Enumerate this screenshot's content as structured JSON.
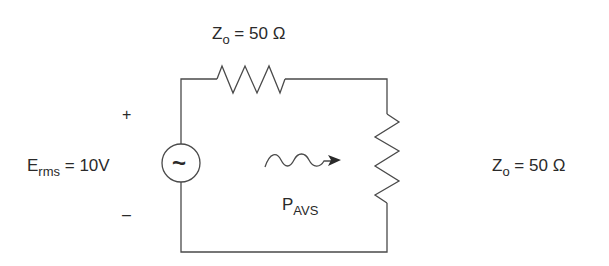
{
  "diagram": {
    "type": "circuit",
    "source": {
      "symbol": "~",
      "label_main": "E",
      "label_sub": "rms",
      "label_value": " = 10V",
      "plus": "+",
      "minus": "–"
    },
    "series_resistor": {
      "label_main": "Z",
      "label_sub": "o",
      "label_value": " = 50 Ω"
    },
    "load_resistor": {
      "label_main": "Z",
      "label_sub": "o",
      "label_value": " = 50 Ω"
    },
    "power_flow": {
      "label_main": "P",
      "label_sub": "AVS"
    },
    "colors": {
      "line": "#4a4a4a",
      "text": "#2a2a2a",
      "background": "#ffffff"
    }
  }
}
